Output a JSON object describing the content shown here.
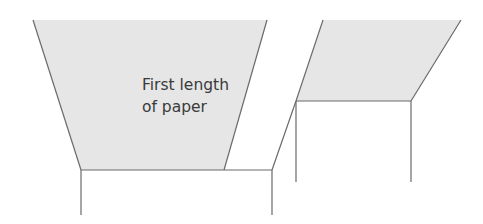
{
  "colors": {
    "paper_fill": "#e6e6e6",
    "line": "#6a6a6a",
    "background": "#ffffff",
    "text": "#3a3a3a"
  },
  "label": {
    "line1": "First length",
    "line2": "of paper"
  },
  "shapes": {
    "left_paper": {
      "points": "33,20 267,20 224,170 81,170"
    },
    "left_box": {
      "top_line": "81,170 272,170",
      "left_post": "81,170 81,215",
      "right_post": "272,170 272,215"
    },
    "connector": "272,170 296,101",
    "right_paper": {
      "points": "323,20 461,20 411,101 296,101"
    },
    "right_box": {
      "left_post": "296,101 296,182",
      "right_post": "411,101 411,182"
    }
  }
}
